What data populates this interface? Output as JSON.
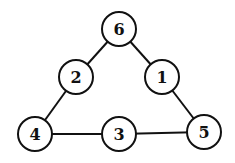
{
  "diagram": {
    "type": "graph",
    "stroke_color": "#111111",
    "fill_color": "#ffffff",
    "node_radius": 17,
    "nodes": [
      {
        "id": "n6",
        "label": "6",
        "x": 119,
        "y": 29
      },
      {
        "id": "n2",
        "label": "2",
        "x": 76,
        "y": 77
      },
      {
        "id": "n1",
        "label": "1",
        "x": 162,
        "y": 77
      },
      {
        "id": "n4",
        "label": "4",
        "x": 35,
        "y": 134
      },
      {
        "id": "n3",
        "label": "3",
        "x": 119,
        "y": 134
      },
      {
        "id": "n5",
        "label": "5",
        "x": 204,
        "y": 132
      }
    ],
    "edges": [
      {
        "from": "n6",
        "to": "n2"
      },
      {
        "from": "n6",
        "to": "n1"
      },
      {
        "from": "n2",
        "to": "n4"
      },
      {
        "from": "n1",
        "to": "n5"
      },
      {
        "from": "n4",
        "to": "n3"
      },
      {
        "from": "n3",
        "to": "n5"
      }
    ]
  }
}
